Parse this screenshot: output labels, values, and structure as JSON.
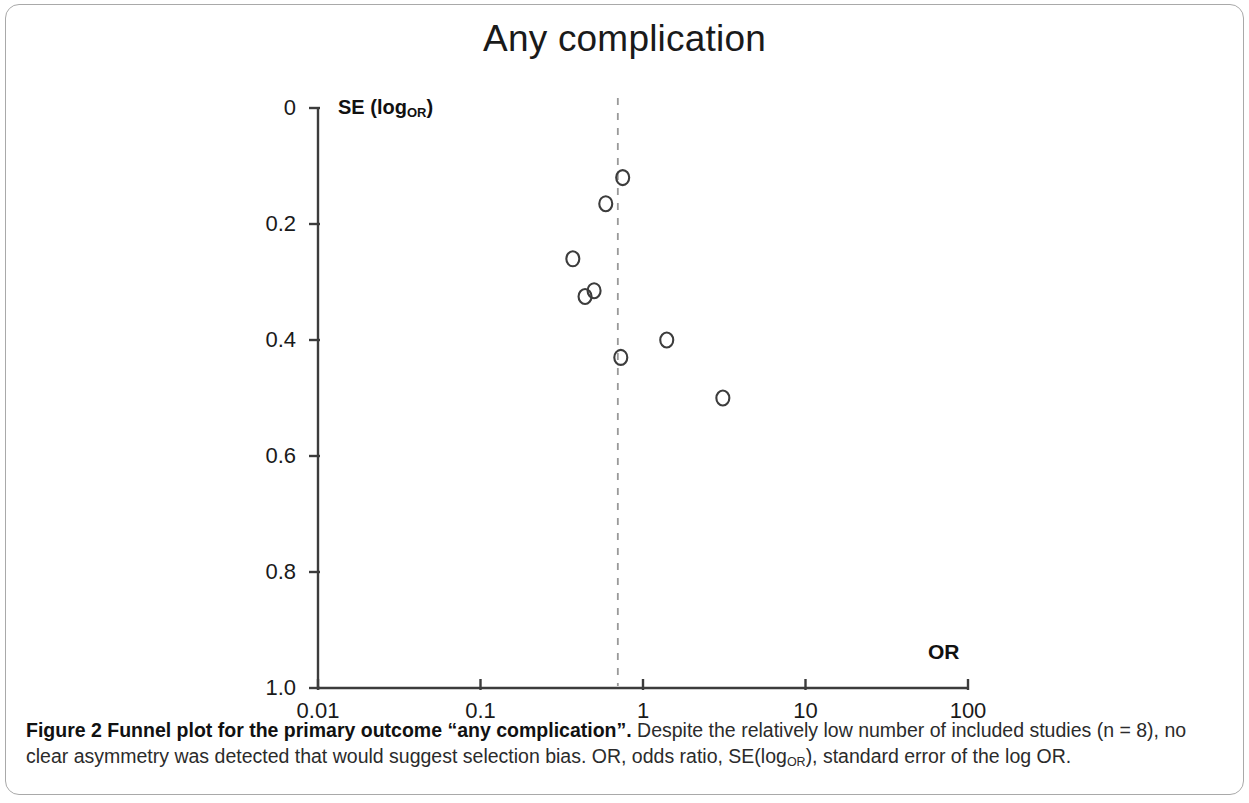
{
  "figure": {
    "caption_lead": "Figure 2 Funnel plot for the primary outcome “any complication”.",
    "caption_rest_1": " Despite the relatively low number of included studies (n = 8), no clear asymmetry was detected that would suggest selection bias. OR, odds ratio, SE(log",
    "caption_sub": "OR",
    "caption_rest_2": "), standard error of the log OR."
  },
  "chart_data": {
    "type": "scatter",
    "title": "Any complication",
    "xlabel": "OR",
    "ylabel_text": "SE (log",
    "ylabel_sub": "OR",
    "ylabel_close": ")",
    "x_scale": "log10",
    "xlim": [
      0.01,
      100
    ],
    "ylim": [
      0,
      1.0
    ],
    "y_inverted": true,
    "grid": false,
    "legend": null,
    "x_ticks": [
      {
        "value": 0.01,
        "label": "0.01"
      },
      {
        "value": 0.1,
        "label": "0.1"
      },
      {
        "value": 1,
        "label": "1"
      },
      {
        "value": 10,
        "label": "10"
      },
      {
        "value": 100,
        "label": "100"
      }
    ],
    "y_ticks": [
      {
        "value": 0,
        "label": "0"
      },
      {
        "value": 0.2,
        "label": "0.2"
      },
      {
        "value": 0.4,
        "label": "0.4"
      },
      {
        "value": 0.6,
        "label": "0.6"
      },
      {
        "value": 0.8,
        "label": "0.8"
      },
      {
        "value": 1.0,
        "label": "1.0"
      }
    ],
    "reference_line": {
      "value": 0.7,
      "style": "dashed",
      "color": "#999999",
      "orientation": "vertical"
    },
    "marker": {
      "shape": "open-circle",
      "radius": 7,
      "stroke": "#3c3c3c",
      "fill": "none"
    },
    "points": [
      {
        "or": 0.75,
        "se": 0.12
      },
      {
        "or": 0.59,
        "se": 0.165
      },
      {
        "or": 0.37,
        "se": 0.26
      },
      {
        "or": 0.44,
        "se": 0.325
      },
      {
        "or": 0.5,
        "se": 0.315
      },
      {
        "or": 0.73,
        "se": 0.43
      },
      {
        "or": 1.4,
        "se": 0.4
      },
      {
        "or": 3.1,
        "se": 0.5
      }
    ],
    "axis_geometry": {
      "x_pixel_at_min": 318,
      "x_pixel_at_max": 968,
      "y_pixel_at_min": 108,
      "y_pixel_at_max": 688
    },
    "colors": {
      "axis": "#3c3c3c",
      "text": "#1a1a1a",
      "reference_line": "#999999"
    }
  }
}
